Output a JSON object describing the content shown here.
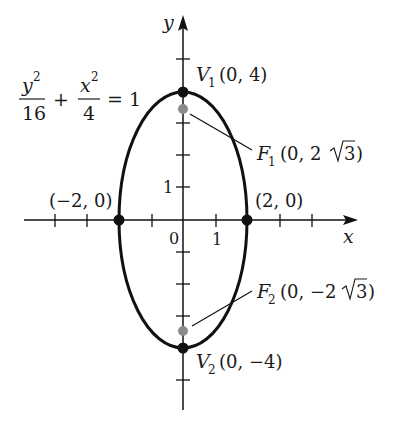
{
  "equation": {
    "num1": "y",
    "num1_exp": "2",
    "den1": "16",
    "plus": "+",
    "num2": "x",
    "num2_exp": "2",
    "den2": "4",
    "rhs": "= 1"
  },
  "axes": {
    "x_label": "x",
    "y_label": "y",
    "origin_label": "0",
    "x_tick_label": "1",
    "y_tick_label": "1"
  },
  "points": {
    "v1": {
      "name": "V",
      "sub": "1",
      "coords": "(0, 4)"
    },
    "v2": {
      "name": "V",
      "sub": "2",
      "coords": "(0, −4)"
    },
    "f1": {
      "name": "F",
      "sub": "1",
      "coords_pre": "(0, 2",
      "coords_rad": "3",
      "coords_post": ")"
    },
    "f2": {
      "name": "F",
      "sub": "2",
      "coords_pre": "(0, −2",
      "coords_rad": "3",
      "coords_post": ")"
    },
    "left_vertex": "(−2, 0)",
    "right_vertex": "(2, 0)"
  },
  "colors": {
    "curve": "#111111",
    "vertex_dot": "#111111",
    "focus_dot": "#8a8a8a"
  }
}
